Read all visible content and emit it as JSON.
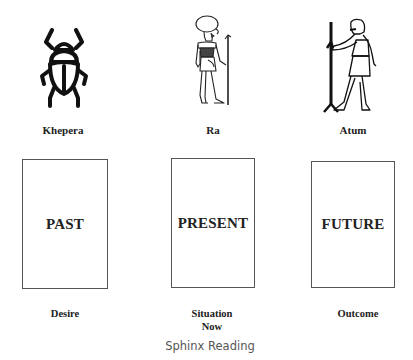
{
  "gods": [
    {
      "name": "Khepera",
      "icon": "scarab-icon"
    },
    {
      "name": "Ra",
      "icon": "ra-figure-icon"
    },
    {
      "name": "Atum",
      "icon": "atum-figure-icon"
    }
  ],
  "cards": [
    {
      "title": "PAST",
      "position_label": "Desire",
      "position_label_line2": ""
    },
    {
      "title": "PRESENT",
      "position_label": "Situation",
      "position_label_line2": "Now"
    },
    {
      "title": "FUTURE",
      "position_label": "Outcome",
      "position_label_line2": ""
    }
  ],
  "caption": "Sphinx Reading"
}
